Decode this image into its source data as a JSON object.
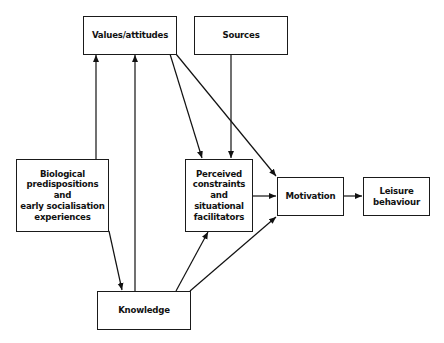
{
  "diagram": {
    "nodes": {
      "values": "Values/attitudes",
      "sources": "Sources",
      "biological": "Biological\npredispositions\nand\nearly socialisation\nexperiences",
      "perceived": "Perceived\nconstraints\nand\nsituational\nfacilitators",
      "motivation": "Motivation",
      "leisure": "Leisure\nbehaviour",
      "knowledge": "Knowledge"
    },
    "edges": [
      {
        "from": "biological",
        "to": "values"
      },
      {
        "from": "knowledge",
        "to": "values"
      },
      {
        "from": "biological",
        "to": "knowledge"
      },
      {
        "from": "values",
        "to": "perceived"
      },
      {
        "from": "values",
        "to": "motivation"
      },
      {
        "from": "sources",
        "to": "perceived"
      },
      {
        "from": "knowledge",
        "to": "perceived"
      },
      {
        "from": "knowledge",
        "to": "motivation"
      },
      {
        "from": "perceived",
        "to": "motivation"
      },
      {
        "from": "motivation",
        "to": "leisure"
      }
    ]
  }
}
